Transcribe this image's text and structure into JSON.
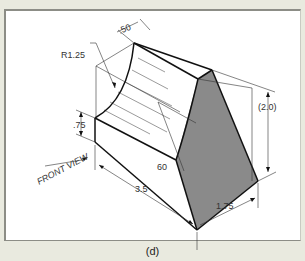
{
  "figure": {
    "caption": "(d)",
    "view_label": "FRONT VIEW",
    "dimensions": {
      "top_width": ".50",
      "radius": "R1.25",
      "left_height": ".75",
      "angle": "60",
      "length": "3.5",
      "depth": "1.75",
      "overall_height": "(2.0)"
    },
    "colors": {
      "shaded_face": "#8a8a8a",
      "line": "#111111",
      "background": "#e9eadf",
      "paper": "#ffffff"
    }
  }
}
